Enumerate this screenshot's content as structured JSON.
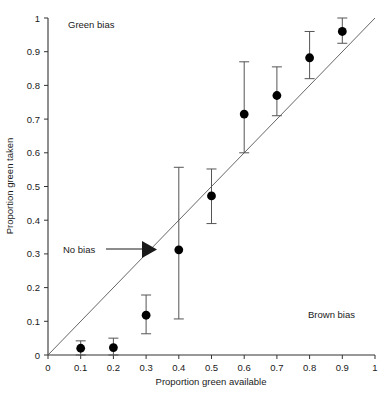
{
  "chart_data": {
    "type": "scatter",
    "title": "",
    "xlabel": "Proportion green available",
    "ylabel": "Proportion green taken",
    "xlim": [
      0,
      1
    ],
    "ylim": [
      0,
      1
    ],
    "grid": false,
    "legend": "none",
    "xticks": [
      "0",
      "0.1",
      "0.2",
      "0.3",
      "0.4",
      "0.5",
      "0.6",
      "0.7",
      "0.8",
      "0.9",
      "1"
    ],
    "xtick_values": [
      0,
      0.1,
      0.2,
      0.3,
      0.4,
      0.5,
      0.6,
      0.7,
      0.8,
      0.9,
      1
    ],
    "yticks": [
      "0",
      "0.1",
      "0.2",
      "0.3",
      "0.4",
      "0.5",
      "0.6",
      "0.7",
      "0.8",
      "0.9",
      "1"
    ],
    "ytick_values": [
      0,
      0.1,
      0.2,
      0.3,
      0.4,
      0.5,
      0.6,
      0.7,
      0.8,
      0.9,
      1
    ],
    "x": [
      0.1,
      0.2,
      0.3,
      0.4,
      0.5,
      0.6,
      0.7,
      0.8,
      0.9
    ],
    "y": [
      0.02,
      0.022,
      0.118,
      0.312,
      0.472,
      0.715,
      0.77,
      0.882,
      0.96
    ],
    "error_low": [
      0.02,
      0.022,
      0.055,
      0.205,
      0.082,
      0.115,
      0.06,
      0.062,
      0.035
    ],
    "error_high": [
      0.022,
      0.028,
      0.06,
      0.245,
      0.08,
      0.155,
      0.085,
      0.078,
      0.04
    ],
    "reference_line": {
      "label": "No bias",
      "from": [
        0,
        0
      ],
      "to": [
        1,
        1
      ]
    },
    "annotations": [
      {
        "text": "Green bias",
        "x": 0.17,
        "y": 0.975
      },
      {
        "text": "Brown bias",
        "x": 0.8,
        "y": 0.115
      },
      {
        "text": "No bias",
        "x": 0.065,
        "y": 0.315
      }
    ],
    "marker_color": "#000000",
    "line_color": "#555555",
    "errorbar_color": "#555555",
    "axis_color": "#333333"
  },
  "axis": {
    "x_title": "Proportion green available",
    "y_title": "Proportion green taken"
  },
  "labels": {
    "green_bias": "Green bias",
    "brown_bias": "Brown bias",
    "no_bias": "No bias"
  }
}
